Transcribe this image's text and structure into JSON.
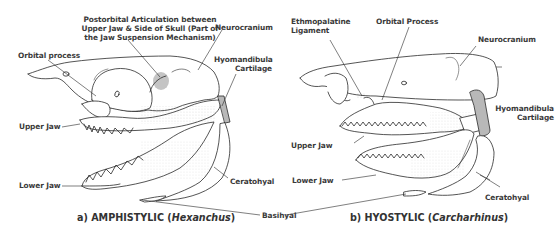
{
  "diagram": {
    "type": "labeled-anatomical-illustration",
    "colors": {
      "line": "#2a2a2a",
      "cartilage_fill": "#b8b8b8",
      "articulation_fill": "#c4c4c4",
      "background": "#ffffff"
    }
  },
  "panel_a": {
    "caption_prefix": "a) AMPHISTYLIC (",
    "caption_genus": "Hexanchus",
    "caption_suffix": ")",
    "labels": {
      "postorbital_line1": "Postorbital Articulation between",
      "postorbital_line2": "Upper Jaw & Side of Skull (Part of",
      "postorbital_line3": "the Jaw Suspension Mechanism)",
      "neurocranium": "Neurocranium",
      "orbital_process": "Orbital process",
      "hyomandibula_line1": "Hyomandibula",
      "hyomandibula_line2": "Cartilage",
      "upper_jaw": "Upper Jaw",
      "lower_jaw": "Lower Jaw",
      "ceratohyal": "Ceratohyal"
    }
  },
  "shared": {
    "basihyal": "Basihyal"
  },
  "panel_b": {
    "caption_prefix": "b) HYOSTYLIC (",
    "caption_genus": "Carcharhinus",
    "caption_suffix": ")",
    "labels": {
      "ethmopalatine_line1": "Ethmopalatine",
      "ethmopalatine_line2": "Ligament",
      "orbital_process": "Orbital Process",
      "neurocranium": "Neurocranium",
      "hyomandibula_line1": "Hyomandibula",
      "hyomandibula_line2": "Cartilage",
      "upper_jaw": "Upper Jaw",
      "lower_jaw": "Lower Jaw",
      "ceratohyal": "Ceratohyal"
    }
  }
}
